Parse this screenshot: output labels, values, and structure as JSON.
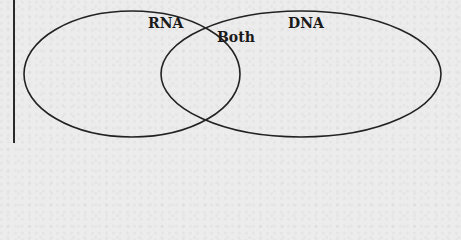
{
  "diagram": {
    "type": "venn",
    "sets": [
      {
        "id": "left",
        "label": "RNA"
      },
      {
        "id": "right",
        "label": "DNA"
      }
    ],
    "intersection_label": "Both",
    "stroke_color": "#222222",
    "background_color": "#ececec"
  }
}
